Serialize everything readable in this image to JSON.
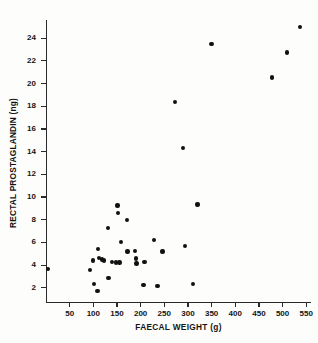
{
  "chart_data": {
    "type": "scatter",
    "title": "",
    "xlabel": "FAECAL WEIGHT (g)",
    "ylabel": "RECTAL PROSTAGLANDIN (ng)",
    "xlim": [
      0,
      560
    ],
    "ylim": [
      0.8,
      25.6
    ],
    "xticks": [
      50,
      100,
      150,
      200,
      250,
      300,
      350,
      400,
      450,
      500,
      550
    ],
    "yticks": [
      2,
      4,
      6,
      8,
      10,
      12,
      14,
      16,
      18,
      20,
      22,
      24
    ],
    "xticklabels": [
      "50",
      "100",
      "150",
      "200",
      "250",
      "300",
      "350",
      "400",
      "450",
      "500",
      "550"
    ],
    "yticklabels": [
      "2",
      "4",
      "6",
      "8",
      "10",
      "12",
      "14",
      "16",
      "18",
      "20",
      "22",
      "24"
    ],
    "grid": false,
    "legend": null,
    "marker": "filled-circle",
    "marker_color": "#111111",
    "points": [
      {
        "x": 4,
        "y": 3.65
      },
      {
        "x": 93,
        "y": 3.6
      },
      {
        "x": 99,
        "y": 4.4
      },
      {
        "x": 101,
        "y": 2.35
      },
      {
        "x": 109,
        "y": 1.7
      },
      {
        "x": 110,
        "y": 5.45
      },
      {
        "x": 112,
        "y": 4.65
      },
      {
        "x": 118,
        "y": 4.5
      },
      {
        "x": 123,
        "y": 4.4
      },
      {
        "x": 131,
        "y": 7.25
      },
      {
        "x": 132,
        "y": 2.85
      },
      {
        "x": 140,
        "y": 4.3
      },
      {
        "x": 148,
        "y": 4.25
      },
      {
        "x": 151,
        "y": 9.25
      },
      {
        "x": 152,
        "y": 8.6
      },
      {
        "x": 155,
        "y": 4.25
      },
      {
        "x": 159,
        "y": 6.05
      },
      {
        "x": 171,
        "y": 8.0
      },
      {
        "x": 172,
        "y": 5.2
      },
      {
        "x": 188,
        "y": 5.25
      },
      {
        "x": 190,
        "y": 4.6
      },
      {
        "x": 191,
        "y": 4.15
      },
      {
        "x": 206,
        "y": 2.25
      },
      {
        "x": 208,
        "y": 4.3
      },
      {
        "x": 228,
        "y": 6.2
      },
      {
        "x": 236,
        "y": 2.15
      },
      {
        "x": 246,
        "y": 5.2
      },
      {
        "x": 272,
        "y": 18.4
      },
      {
        "x": 290,
        "y": 14.3
      },
      {
        "x": 294,
        "y": 5.7
      },
      {
        "x": 310,
        "y": 2.35
      },
      {
        "x": 320,
        "y": 9.35
      },
      {
        "x": 350,
        "y": 23.5
      },
      {
        "x": 478,
        "y": 20.55
      },
      {
        "x": 509,
        "y": 22.75
      },
      {
        "x": 537,
        "y": 25.0
      }
    ]
  }
}
